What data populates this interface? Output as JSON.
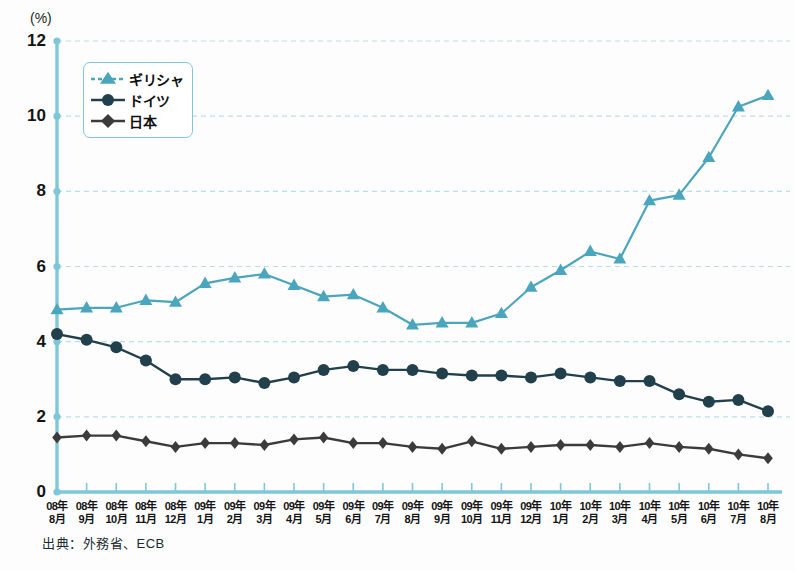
{
  "title": {
    "text_cropped": ""
  },
  "axis": {
    "unit_label": "(%)",
    "y_ticks": [
      "12",
      "10",
      "8",
      "6",
      "4",
      "2",
      "0"
    ],
    "y_min": 0,
    "y_max": 12
  },
  "legend": {
    "items": [
      {
        "label": "ギリシャ",
        "marker": "triangle",
        "style": "dashed",
        "color": "#4ba6bd"
      },
      {
        "label": "ドイツ",
        "marker": "circle",
        "style": "solid",
        "color": "#21404c"
      },
      {
        "label": "日本",
        "marker": "diamond",
        "style": "solid",
        "color": "#3b3b3b"
      }
    ]
  },
  "source": {
    "text": "出典：外務省、ECB"
  },
  "colors": {
    "greece": "#4ba6bd",
    "germany": "#21404c",
    "japan": "#3b3b3b",
    "axis": "#7ec7d8",
    "grid": "#b9dfe8",
    "background": "#fdfdfd"
  },
  "chart_data": {
    "type": "line",
    "title": "",
    "xlabel": "",
    "ylabel": "(%)",
    "ylim": [
      0,
      12
    ],
    "grid": true,
    "legend_position": "upper-left-inside",
    "categories": [
      "08年8月",
      "08年9月",
      "08年10月",
      "08年11月",
      "08年12月",
      "09年1月",
      "09年2月",
      "09年3月",
      "09年4月",
      "09年5月",
      "09年6月",
      "09年7月",
      "09年8月",
      "09年9月",
      "09年10月",
      "09年11月",
      "09年12月",
      "10年1月",
      "10年2月",
      "10年3月",
      "10年4月",
      "10年5月",
      "10年6月",
      "10年7月",
      "10年8月"
    ],
    "series": [
      {
        "name": "ギリシャ",
        "color": "#4ba6bd",
        "marker": "triangle",
        "line_style": "solid",
        "values": [
          4.85,
          4.9,
          4.9,
          5.1,
          5.05,
          5.55,
          5.7,
          5.8,
          5.5,
          5.2,
          5.25,
          4.9,
          4.45,
          4.5,
          4.5,
          4.75,
          5.45,
          5.9,
          6.4,
          6.2,
          7.75,
          7.9,
          8.9,
          10.25,
          10.55
        ]
      },
      {
        "name": "ドイツ",
        "color": "#21404c",
        "marker": "circle",
        "line_style": "solid",
        "values": [
          4.2,
          4.05,
          3.85,
          3.5,
          3.0,
          3.0,
          3.05,
          2.9,
          3.05,
          3.25,
          3.35,
          3.25,
          3.25,
          3.15,
          3.1,
          3.1,
          3.05,
          3.15,
          3.05,
          2.95,
          2.95,
          2.6,
          2.4,
          2.45,
          2.15
        ]
      },
      {
        "name": "日本",
        "color": "#3b3b3b",
        "marker": "diamond",
        "line_style": "solid",
        "values": [
          1.45,
          1.5,
          1.5,
          1.35,
          1.2,
          1.3,
          1.3,
          1.25,
          1.4,
          1.45,
          1.3,
          1.3,
          1.2,
          1.15,
          1.35,
          1.15,
          1.2,
          1.25,
          1.25,
          1.2,
          1.3,
          1.2,
          1.15,
          1.0,
          0.9
        ]
      }
    ]
  }
}
